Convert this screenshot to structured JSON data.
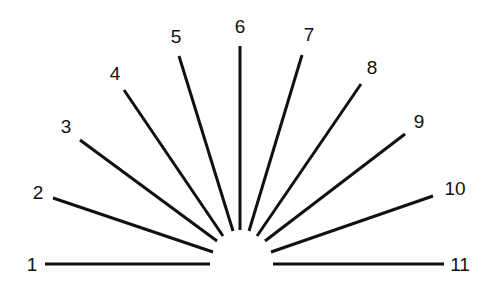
{
  "diagram": {
    "type": "radial-fan",
    "line_color": "#111111",
    "background": "#ffffff",
    "rays": [
      {
        "label": "1",
        "x1": 45,
        "y1": 264,
        "x2": 210,
        "y2": 264,
        "lx": 32,
        "ly": 266
      },
      {
        "label": "2",
        "x1": 53,
        "y1": 198,
        "x2": 213,
        "y2": 252,
        "lx": 38,
        "ly": 194
      },
      {
        "label": "3",
        "x1": 80,
        "y1": 140,
        "x2": 217,
        "y2": 241,
        "lx": 66,
        "ly": 128
      },
      {
        "label": "4",
        "x1": 124,
        "y1": 90,
        "x2": 223,
        "y2": 236,
        "lx": 115,
        "ly": 75
      },
      {
        "label": "5",
        "x1": 179,
        "y1": 56,
        "x2": 233,
        "y2": 231,
        "lx": 176,
        "ly": 38
      },
      {
        "label": "6",
        "x1": 240,
        "y1": 46,
        "x2": 240,
        "y2": 230,
        "lx": 240,
        "ly": 28
      },
      {
        "label": "7",
        "x1": 302,
        "y1": 55,
        "x2": 249,
        "y2": 231,
        "lx": 309,
        "ly": 36
      },
      {
        "label": "8",
        "x1": 361,
        "y1": 84,
        "x2": 257,
        "y2": 236,
        "lx": 372,
        "ly": 69
      },
      {
        "label": "9",
        "x1": 405,
        "y1": 134,
        "x2": 265,
        "y2": 241,
        "lx": 419,
        "ly": 123
      },
      {
        "label": "10",
        "x1": 433,
        "y1": 196,
        "x2": 271,
        "y2": 252,
        "lx": 455,
        "ly": 190
      },
      {
        "label": "11",
        "x1": 444,
        "y1": 264,
        "x2": 273,
        "y2": 264,
        "lx": 460,
        "ly": 266
      }
    ]
  }
}
